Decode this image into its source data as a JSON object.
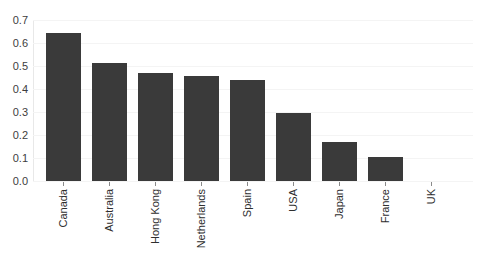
{
  "chart_data": {
    "type": "bar",
    "title": "",
    "subtitle": "",
    "xlabel": "",
    "ylabel": "",
    "categories": [
      "Canada",
      "Australia",
      "Hong Kong",
      "Netherlands",
      "Spain",
      "USA",
      "Japan",
      "France",
      "UK"
    ],
    "values": [
      0.645,
      0.512,
      0.468,
      0.455,
      0.44,
      0.295,
      0.168,
      0.105,
      0.0
    ],
    "series": [
      {
        "name": "",
        "values": [
          0.645,
          0.512,
          0.468,
          0.455,
          0.44,
          0.295,
          0.168,
          0.105,
          0.0
        ]
      }
    ],
    "ylim": [
      0.0,
      0.7
    ],
    "yticks": [
      0.0,
      0.1,
      0.2,
      0.3,
      0.4,
      0.5,
      0.6,
      0.7
    ],
    "ytick_labels": [
      "0.0",
      "0.1",
      "0.2",
      "0.3",
      "0.4",
      "0.5",
      "0.6",
      "0.7"
    ],
    "grid": true,
    "grid_axis": "y",
    "legend": false,
    "legend_position": "none",
    "bar_color": "#3a3a3a",
    "gridline_color": "#f4f4f4",
    "axis_color": "#dcdcdc",
    "background_color": "#ffffff",
    "xtick_label_rotation": 90,
    "annotations": []
  }
}
